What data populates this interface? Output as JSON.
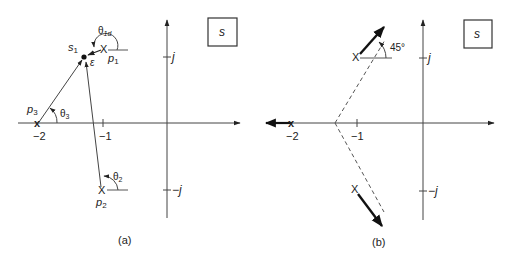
{
  "panels": [
    {
      "id": "a",
      "caption": "(a)",
      "plane_label": "s",
      "axis_labels": {
        "neg2": "−2",
        "neg1": "−1",
        "j": "j",
        "negj": "−j",
        "negj_prefix": "−"
      },
      "points": {
        "s1": {
          "label": "s",
          "sub": "1"
        },
        "p1": {
          "label": "p",
          "sub": "1"
        },
        "p2": {
          "label": "p",
          "sub": "2"
        },
        "p3": {
          "label": "p",
          "sub": "3"
        }
      },
      "angles": {
        "theta1d": {
          "label": "θ",
          "sub": "1d"
        },
        "theta2": {
          "label": "θ",
          "sub": "2"
        },
        "theta3": {
          "label": "θ",
          "sub": "3"
        }
      },
      "epsilon": "ε"
    },
    {
      "id": "b",
      "caption": "(b)",
      "plane_label": "s",
      "axis_labels": {
        "neg2": "−2",
        "neg1": "−1",
        "j": "j",
        "negj": "−j"
      },
      "angle_label": "45°"
    }
  ],
  "colors": {
    "line": "#444444",
    "text": "#222222",
    "bold": "#111111"
  }
}
